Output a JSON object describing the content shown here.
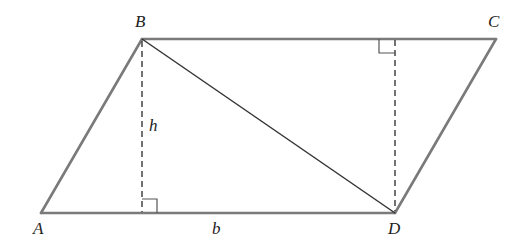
{
  "figure": {
    "type": "parallelogram-area-diagram",
    "vertices": {
      "A": {
        "label": "A",
        "x": 41,
        "y": 213
      },
      "B": {
        "label": "B",
        "x": 142,
        "y": 39
      },
      "C": {
        "label": "C",
        "x": 496,
        "y": 39
      },
      "D": {
        "label": "D",
        "x": 395,
        "y": 213
      }
    },
    "edges": [
      {
        "from": "A",
        "to": "B",
        "style": "solid",
        "color": "#7a7a7a"
      },
      {
        "from": "B",
        "to": "C",
        "style": "solid",
        "color": "#7a7a7a"
      },
      {
        "from": "C",
        "to": "D",
        "style": "solid",
        "color": "#7a7a7a"
      },
      {
        "from": "D",
        "to": "A",
        "style": "solid",
        "color": "#7a7a7a"
      }
    ],
    "diagonal": {
      "from": "B",
      "to": "D",
      "style": "solid",
      "color": "#333333"
    },
    "altitudes": [
      {
        "from": "B",
        "foot_x": 142,
        "foot_y": 213,
        "style": "dashed",
        "label": "h"
      },
      {
        "from": "D",
        "foot_x": 395,
        "foot_y": 39,
        "style": "dashed"
      }
    ],
    "labels": {
      "A": "A",
      "B": "B",
      "C": "C",
      "D": "D",
      "height": "h",
      "base": "b"
    },
    "right_angle_markers": 2
  }
}
